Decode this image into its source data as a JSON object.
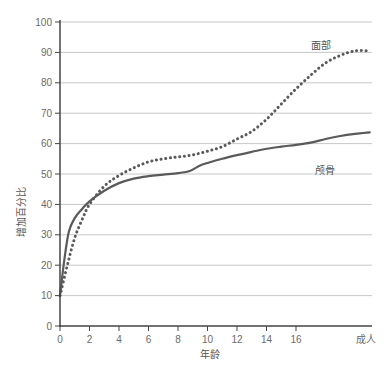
{
  "chart_data": {
    "type": "line",
    "title": "",
    "xlabel": "年龄",
    "ylabel": "增加百分比",
    "ylim": [
      0,
      100
    ],
    "yticks": [
      0,
      10,
      20,
      30,
      40,
      50,
      60,
      70,
      80,
      90,
      100
    ],
    "xticks": [
      {
        "value": 0,
        "label": "0"
      },
      {
        "value": 2,
        "label": "2"
      },
      {
        "value": 4,
        "label": "4"
      },
      {
        "value": 6,
        "label": "6"
      },
      {
        "value": 8,
        "label": "8"
      },
      {
        "value": 10,
        "label": "10"
      },
      {
        "value": 12,
        "label": "12"
      },
      {
        "value": 14,
        "label": "14"
      },
      {
        "value": 16,
        "label": "16"
      },
      {
        "value": 21,
        "label": "成人"
      }
    ],
    "grid": {
      "horizontal": true,
      "vertical": false
    },
    "legend": "inline labels",
    "series": [
      {
        "name": "面部",
        "style": "dotted",
        "color": "#5a5a5a",
        "label_pos": {
          "x": 17,
          "y": 91
        },
        "points": [
          [
            0,
            10
          ],
          [
            0.5,
            20
          ],
          [
            1,
            29
          ],
          [
            1.5,
            35
          ],
          [
            2,
            40
          ],
          [
            3,
            46
          ],
          [
            4,
            49.5
          ],
          [
            5,
            52
          ],
          [
            6,
            54
          ],
          [
            7,
            55
          ],
          [
            8,
            55.6
          ],
          [
            9,
            56.3
          ],
          [
            10,
            57.5
          ],
          [
            11,
            59
          ],
          [
            12,
            61.5
          ],
          [
            13,
            64
          ],
          [
            14,
            68
          ],
          [
            15,
            73
          ],
          [
            16,
            78
          ],
          [
            17,
            82.5
          ],
          [
            18,
            86.5
          ],
          [
            19,
            89
          ],
          [
            20,
            90.5
          ],
          [
            21,
            90.5
          ]
        ]
      },
      {
        "name": "颅骨",
        "style": "solid",
        "color": "#5a5a5a",
        "label_pos": {
          "x": 17.3,
          "y": 51.5
        },
        "points": [
          [
            0,
            10
          ],
          [
            0.3,
            22
          ],
          [
            0.6,
            31
          ],
          [
            1,
            35.5
          ],
          [
            1.5,
            38.5
          ],
          [
            2,
            41
          ],
          [
            3,
            44.5
          ],
          [
            4,
            47
          ],
          [
            5,
            48.5
          ],
          [
            6,
            49.3
          ],
          [
            7,
            49.8
          ],
          [
            8,
            50.3
          ],
          [
            8.8,
            51
          ],
          [
            9.5,
            52.8
          ],
          [
            10,
            53.6
          ],
          [
            11,
            55
          ],
          [
            12,
            56.2
          ],
          [
            13,
            57.3
          ],
          [
            14,
            58.3
          ],
          [
            15,
            59
          ],
          [
            16,
            59.6
          ],
          [
            17,
            60.3
          ],
          [
            18,
            61.5
          ],
          [
            19,
            62.5
          ],
          [
            20,
            63.2
          ],
          [
            21,
            63.7
          ]
        ]
      }
    ]
  }
}
